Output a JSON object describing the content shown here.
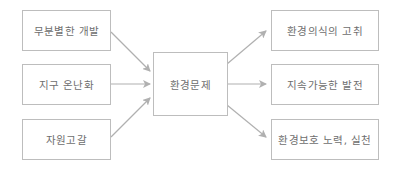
{
  "diagram": {
    "causes": [
      {
        "label": "무분별한 개발"
      },
      {
        "label": "지구 온난화"
      },
      {
        "label": "자원고갈"
      }
    ],
    "center": {
      "label": "환경문제"
    },
    "outcomes": [
      {
        "label": "환경의식의 고취"
      },
      {
        "label": "지속가능한 발전"
      },
      {
        "label": "환경보호 노력, 실천"
      }
    ],
    "colors": {
      "border": "#bdbdbd",
      "arrow": "#b0b0b0",
      "text": "#6e6e6e"
    }
  }
}
